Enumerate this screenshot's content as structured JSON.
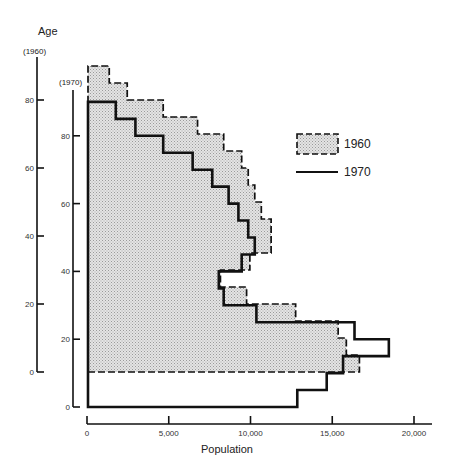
{
  "chart_data": {
    "type": "bar",
    "subtype": "population-pyramid-half (step histogram)",
    "title": "",
    "xlabel": "Population",
    "ylabel": "Age",
    "xlim": [
      0,
      20000
    ],
    "x_ticks": [
      0,
      5000,
      10000,
      15000,
      20000
    ],
    "x_tick_labels": [
      "0",
      "5,000",
      "10,000",
      "15,000",
      "20,000"
    ],
    "y_axes": [
      {
        "label": "(1960)",
        "ticks": [
          0,
          20,
          40,
          60,
          80
        ],
        "tick_labels": [
          "0",
          "20",
          "40",
          "60",
          "80"
        ]
      },
      {
        "label": "(1970)",
        "ticks": [
          0,
          20,
          40,
          60,
          80
        ],
        "tick_labels": [
          "0",
          "20",
          "40",
          "60",
          "80"
        ]
      }
    ],
    "age_band_width": 5,
    "categories": [
      "0-4",
      "5-9",
      "10-14",
      "15-19",
      "20-24",
      "25-29",
      "30-34",
      "35-39",
      "40-44",
      "45-49",
      "50-54",
      "55-59",
      "60-64",
      "65-69",
      "70-74",
      "75-79",
      "80-84",
      "85-89"
    ],
    "series": [
      {
        "name": "1960",
        "style": "dashed outline, stippled gray fill",
        "values": [
          16600,
          15800,
          15300,
          12700,
          9700,
          8100,
          9900,
          11200,
          11200,
          10600,
          10200,
          9800,
          9400,
          8300,
          6700,
          4600,
          2400,
          1300
        ]
      },
      {
        "name": "1970",
        "style": "solid thick outline",
        "values": [
          12800,
          14600,
          15600,
          18400,
          16300,
          10300,
          8300,
          8000,
          9400,
          10200,
          9800,
          9200,
          8600,
          7600,
          6400,
          4600,
          2900,
          1700
        ]
      }
    ],
    "legend": {
      "position": "right",
      "entries": [
        "1960",
        "1970"
      ]
    },
    "grid": false
  },
  "colors": {
    "fill_1960": "#d4d4d4",
    "line": "#111111"
  }
}
